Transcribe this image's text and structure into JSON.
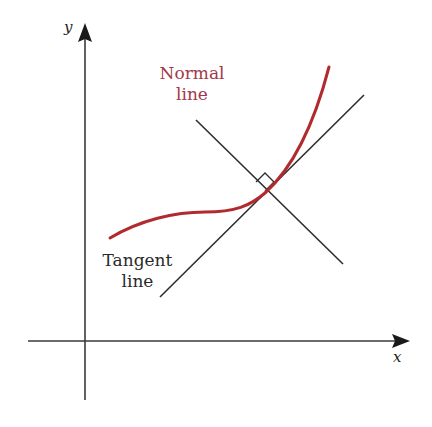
{
  "figure": {
    "type": "geometric-diagram"
  },
  "axes": {
    "x_label": "x",
    "y_label": "y"
  },
  "labels": {
    "normal_line_1": "Normal",
    "normal_line_2": "line",
    "tangent_line_1": "Tangent",
    "tangent_line_2": "line"
  },
  "colors": {
    "curve": "#b02a2e",
    "normal_label": "#a3384a",
    "lines": "#2a2a2a",
    "axes": "#333333",
    "background": "#ffffff"
  }
}
